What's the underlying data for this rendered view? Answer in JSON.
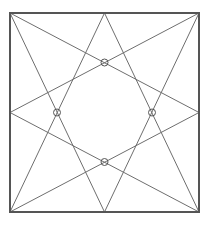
{
  "diagram": {
    "colors": {
      "background": "#ffffff",
      "border": "#555555",
      "line": "#6e6e6e",
      "marker": "#555555"
    },
    "square": {
      "x": 10,
      "y": 13,
      "width": 189,
      "height": 199,
      "stroke_width": 2
    },
    "points": {
      "top_left": [
        10,
        13
      ],
      "top_right": [
        199,
        13
      ],
      "bottom_left": [
        10,
        212
      ],
      "bottom_right": [
        199,
        212
      ],
      "top_mid": [
        104.5,
        13
      ],
      "bottom_mid": [
        104.5,
        212
      ],
      "left_mid": [
        10,
        112.5
      ],
      "right_mid": [
        199,
        112.5
      ]
    },
    "lines": [
      {
        "from": "top_left",
        "to": "bottom_mid"
      },
      {
        "from": "top_left",
        "to": "right_mid"
      },
      {
        "from": "top_right",
        "to": "bottom_mid"
      },
      {
        "from": "top_right",
        "to": "left_mid"
      },
      {
        "from": "bottom_left",
        "to": "top_mid"
      },
      {
        "from": "bottom_left",
        "to": "right_mid"
      },
      {
        "from": "bottom_right",
        "to": "top_mid"
      },
      {
        "from": "bottom_right",
        "to": "left_mid"
      }
    ],
    "markers": [
      {
        "name": "top",
        "cx": 104.5,
        "cy": 62.5,
        "r": 3.5
      },
      {
        "name": "left",
        "cx": 57,
        "cy": 112.5,
        "r": 3.5
      },
      {
        "name": "right",
        "cx": 152,
        "cy": 112.5,
        "r": 3.5
      },
      {
        "name": "bottom",
        "cx": 104.5,
        "cy": 162,
        "r": 3.5
      }
    ]
  }
}
